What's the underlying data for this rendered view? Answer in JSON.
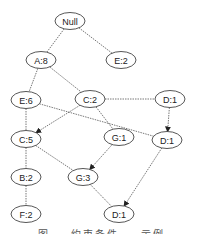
{
  "diagram": {
    "type": "tree",
    "nodes": [
      {
        "id": "null",
        "label": "Null",
        "x": 70,
        "y": 21
      },
      {
        "id": "a8",
        "label": "A:8",
        "x": 41,
        "y": 60
      },
      {
        "id": "e2",
        "label": "E:2",
        "x": 121,
        "y": 60
      },
      {
        "id": "e6",
        "label": "E:6",
        "x": 26,
        "y": 100
      },
      {
        "id": "c2",
        "label": "C:2",
        "x": 90,
        "y": 99
      },
      {
        "id": "d1a",
        "label": "D:1",
        "x": 170,
        "y": 99
      },
      {
        "id": "c5",
        "label": "C:5",
        "x": 26,
        "y": 139
      },
      {
        "id": "g1",
        "label": "G:1",
        "x": 119,
        "y": 137
      },
      {
        "id": "d1b",
        "label": "D:1",
        "x": 167,
        "y": 140
      },
      {
        "id": "b2",
        "label": "B:2",
        "x": 26,
        "y": 177
      },
      {
        "id": "g3",
        "label": "G:3",
        "x": 83,
        "y": 177
      },
      {
        "id": "f2",
        "label": "F:2",
        "x": 26,
        "y": 214
      },
      {
        "id": "d1c",
        "label": "D:1",
        "x": 119,
        "y": 214
      }
    ],
    "edges": [
      {
        "from": "null",
        "to": "a8",
        "arrow": false
      },
      {
        "from": "null",
        "to": "e2",
        "arrow": false
      },
      {
        "from": "a8",
        "to": "e6",
        "arrow": false
      },
      {
        "from": "a8",
        "to": "c2",
        "arrow": false
      },
      {
        "from": "c2",
        "to": "d1a",
        "arrow": false
      },
      {
        "from": "e6",
        "to": "c5",
        "arrow": false
      },
      {
        "from": "e6",
        "to": "d1b",
        "arrow": false
      },
      {
        "from": "c2",
        "to": "c5",
        "arrow": true
      },
      {
        "from": "c2",
        "to": "g1",
        "arrow": false
      },
      {
        "from": "d1a",
        "to": "d1b",
        "arrow": true
      },
      {
        "from": "c5",
        "to": "b2",
        "arrow": false
      },
      {
        "from": "c5",
        "to": "g3",
        "arrow": false
      },
      {
        "from": "g1",
        "to": "g3",
        "arrow": true
      },
      {
        "from": "b2",
        "to": "f2",
        "arrow": false
      },
      {
        "from": "g3",
        "to": "d1c",
        "arrow": false
      },
      {
        "from": "d1b",
        "to": "d1c",
        "arrow": true
      }
    ],
    "caption": "图 … 约束条件 … 示例"
  }
}
